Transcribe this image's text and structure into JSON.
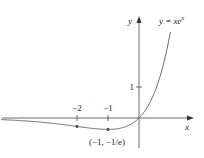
{
  "chart_data": {
    "type": "line",
    "title": "",
    "function_label": "y = xe^x",
    "function_label_parts": {
      "prefix": "y = ",
      "base": "xe",
      "exp": "x"
    },
    "xlabel": "x",
    "ylabel": "y",
    "x_ticks": [
      {
        "value": -2,
        "label": "−2"
      },
      {
        "value": -1,
        "label": "−1"
      }
    ],
    "y_ticks": [
      {
        "value": 1,
        "label": "1"
      }
    ],
    "annotations": [
      {
        "x": -1,
        "y": -0.3679,
        "label": "(−1, −1/e)"
      }
    ],
    "marked_points": [
      {
        "x": -2,
        "y": -0.2707
      },
      {
        "x": -1,
        "y": -0.3679
      }
    ],
    "series": [
      {
        "name": "y = xe^x",
        "x": [
          -4.4,
          -4,
          -3,
          -2,
          -1.5,
          -1,
          -0.5,
          0,
          0.5,
          1,
          1.3
        ],
        "values": [
          -0.054,
          -0.073,
          -0.149,
          -0.271,
          -0.335,
          -0.368,
          -0.303,
          0,
          0.824,
          2.718,
          4.77
        ]
      }
    ],
    "xlim": [
      -4.4,
      1.75
    ],
    "ylim": [
      -1.0,
      3.3
    ],
    "grid": false
  }
}
